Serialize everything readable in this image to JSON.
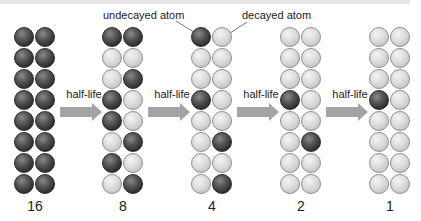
{
  "diagram": {
    "callouts": {
      "undecayed": "undecayed atom",
      "decayed": "decayed atom"
    },
    "step_label": "half-life",
    "colors": {
      "undecayed_atom": "#3a3a3a",
      "decayed_atom": "#d8d8d8",
      "arrow": "#a3a3a3"
    },
    "columns": [
      {
        "count": "16",
        "rows": [
          [
            "U",
            "U"
          ],
          [
            "U",
            "U"
          ],
          [
            "U",
            "U"
          ],
          [
            "U",
            "U"
          ],
          [
            "U",
            "U"
          ],
          [
            "U",
            "U"
          ],
          [
            "U",
            "U"
          ],
          [
            "U",
            "U"
          ]
        ]
      },
      {
        "count": "8",
        "rows": [
          [
            "U",
            "U"
          ],
          [
            "D",
            "D"
          ],
          [
            "D",
            "U"
          ],
          [
            "U",
            "D"
          ],
          [
            "U",
            "D"
          ],
          [
            "D",
            "U"
          ],
          [
            "U",
            "D"
          ],
          [
            "D",
            "U"
          ]
        ]
      },
      {
        "count": "4",
        "rows": [
          [
            "U",
            "D"
          ],
          [
            "D",
            "D"
          ],
          [
            "D",
            "D"
          ],
          [
            "U",
            "D"
          ],
          [
            "D",
            "D"
          ],
          [
            "D",
            "U"
          ],
          [
            "D",
            "D"
          ],
          [
            "D",
            "U"
          ]
        ]
      },
      {
        "count": "2",
        "rows": [
          [
            "D",
            "D"
          ],
          [
            "D",
            "D"
          ],
          [
            "D",
            "D"
          ],
          [
            "U",
            "D"
          ],
          [
            "D",
            "D"
          ],
          [
            "D",
            "U"
          ],
          [
            "D",
            "D"
          ],
          [
            "D",
            "D"
          ]
        ]
      },
      {
        "count": "1",
        "rows": [
          [
            "D",
            "D"
          ],
          [
            "D",
            "D"
          ],
          [
            "D",
            "D"
          ],
          [
            "U",
            "D"
          ],
          [
            "D",
            "D"
          ],
          [
            "D",
            "D"
          ],
          [
            "D",
            "D"
          ],
          [
            "D",
            "D"
          ]
        ]
      }
    ],
    "steps": [
      "half-life",
      "half-life",
      "half-life",
      "half-life"
    ]
  }
}
